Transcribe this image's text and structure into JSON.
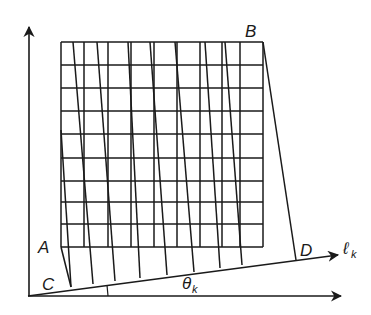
{
  "diagram": {
    "type": "geometric-mesh-projection",
    "colors": {
      "line": "#1a1a1a",
      "background": "#ffffff"
    },
    "labels": {
      "A": "A",
      "B": "B",
      "C": "C",
      "D": "D",
      "line_label": "ℓ",
      "line_sub": "k",
      "angle_label": "θ",
      "angle_sub": "k"
    },
    "axes": {
      "origin": [
        28,
        296
      ],
      "vertical_arrow_tip": [
        29,
        27
      ],
      "horizontal_arrow_tip": [
        341,
        296
      ]
    },
    "line_lk": {
      "start": [
        28,
        296
      ],
      "end": [
        338,
        255
      ]
    },
    "grid": {
      "left": 61,
      "right": 263,
      "top": 42,
      "bottom": 247,
      "rows_y": [
        42,
        65,
        88,
        111,
        134,
        158,
        181,
        202,
        224,
        247
      ],
      "cols_x": [
        61,
        84,
        108,
        131,
        154,
        177,
        200,
        222,
        240,
        263
      ]
    },
    "slanted_lines": [
      {
        "top": [
          61,
          130
        ],
        "bottom": [
          71,
          287
        ]
      },
      {
        "top": [
          73,
          42
        ],
        "bottom": [
          93,
          284
        ]
      },
      {
        "top": [
          97,
          42
        ],
        "bottom": [
          115,
          281
        ]
      },
      {
        "top": [
          128,
          42
        ],
        "bottom": [
          140,
          278
        ]
      },
      {
        "top": [
          150,
          42
        ],
        "bottom": [
          167,
          275
        ]
      },
      {
        "top": [
          175,
          42
        ],
        "bottom": [
          194,
          272
        ]
      },
      {
        "top": [
          205,
          42
        ],
        "bottom": [
          220,
          268
        ]
      },
      {
        "top": [
          225,
          42
        ],
        "bottom": [
          242,
          265
        ]
      },
      {
        "top": [
          263,
          42
        ],
        "bottom": [
          296,
          260
        ]
      }
    ],
    "vertical_drops": [
      {
        "top": [
          61,
          247
        ],
        "bottom": [
          71,
          287
        ]
      }
    ],
    "angle_tick": {
      "x": 107,
      "y1": 285,
      "y2": 296
    }
  }
}
